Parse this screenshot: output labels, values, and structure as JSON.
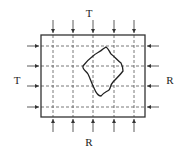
{
  "diagram": {
    "labels": {
      "top": "T",
      "left": "T",
      "right": "R",
      "bottom": "R"
    },
    "grid": {
      "vertical_lines": 5,
      "horizontal_lines": 4
    },
    "colors": {
      "stroke": "#333333",
      "dashed": "#555555",
      "background": "#ffffff"
    }
  }
}
